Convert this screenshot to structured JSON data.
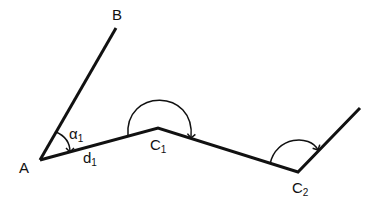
{
  "diagram": {
    "type": "traverse-angle-diagram",
    "points": {
      "A": {
        "label": "A",
        "x": 40,
        "y": 160
      },
      "B": {
        "label": "B",
        "x": 116,
        "y": 28
      },
      "C1": {
        "label": "C",
        "sub": "1",
        "x": 158,
        "y": 128
      },
      "C2": {
        "label": "C",
        "sub": "2",
        "x": 298,
        "y": 172
      },
      "end": {
        "x": 360,
        "y": 108
      }
    },
    "annotations": {
      "angle": {
        "label": "α",
        "sub": "1"
      },
      "distance": {
        "label": "d",
        "sub": "1"
      }
    },
    "stroke_color": "#111111"
  }
}
